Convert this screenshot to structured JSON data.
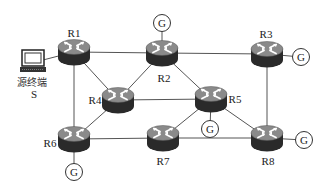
{
  "diagram": {
    "type": "network-topology",
    "source": {
      "label_line1": "源终端",
      "label_line2": "S",
      "x": 33,
      "y": 62
    },
    "routers": [
      {
        "id": "R1",
        "label": "R1",
        "x": 74,
        "y": 52,
        "label_x": 74,
        "label_y": 37
      },
      {
        "id": "R2",
        "label": "R2",
        "x": 162,
        "y": 53,
        "label_x": 164,
        "label_y": 82
      },
      {
        "id": "R3",
        "label": "R3",
        "x": 267,
        "y": 54,
        "label_x": 266,
        "label_y": 38
      },
      {
        "id": "R4",
        "label": "R4",
        "x": 118,
        "y": 100,
        "label_x": 95,
        "label_y": 104
      },
      {
        "id": "R5",
        "label": "R5",
        "x": 211,
        "y": 99,
        "label_x": 235,
        "label_y": 103
      },
      {
        "id": "R6",
        "label": "R6",
        "x": 74,
        "y": 139,
        "label_x": 50,
        "label_y": 147
      },
      {
        "id": "R7",
        "label": "R7",
        "x": 163,
        "y": 138,
        "label_x": 163,
        "label_y": 165
      },
      {
        "id": "R8",
        "label": "R8",
        "x": 267,
        "y": 138,
        "label_x": 268,
        "label_y": 165
      }
    ],
    "gateways": [
      {
        "id": "G2",
        "label": "G",
        "router": "R2",
        "x": 162,
        "y": 23
      },
      {
        "id": "G3",
        "label": "G",
        "router": "R3",
        "x": 301,
        "y": 57
      },
      {
        "id": "G5",
        "label": "G",
        "router": "R5",
        "x": 210,
        "y": 129
      },
      {
        "id": "G6",
        "label": "G",
        "router": "R6",
        "x": 74,
        "y": 172
      },
      {
        "id": "G8",
        "label": "G",
        "router": "R8",
        "x": 304,
        "y": 140
      }
    ],
    "links": [
      [
        "S",
        "R1"
      ],
      [
        "R1",
        "R2"
      ],
      [
        "R1",
        "R4"
      ],
      [
        "R1",
        "R6"
      ],
      [
        "R2",
        "R3"
      ],
      [
        "R2",
        "R4"
      ],
      [
        "R2",
        "R5"
      ],
      [
        "R2",
        "G2"
      ],
      [
        "R3",
        "R8"
      ],
      [
        "R3",
        "G3"
      ],
      [
        "R4",
        "R5"
      ],
      [
        "R4",
        "R6"
      ],
      [
        "R5",
        "R7"
      ],
      [
        "R5",
        "R8"
      ],
      [
        "R5",
        "G5"
      ],
      [
        "R6",
        "R7"
      ],
      [
        "R6",
        "G6"
      ],
      [
        "R7",
        "R8"
      ],
      [
        "R8",
        "G8"
      ]
    ],
    "colors": {
      "router_top": "#8a8a8a",
      "router_body": "#2a2a2a",
      "router_arrows": "#ffffff",
      "link": "#555555",
      "gateway_stroke": "#333333"
    }
  }
}
